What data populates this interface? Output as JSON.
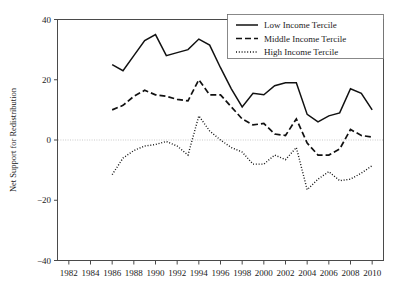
{
  "chart_data": {
    "type": "line",
    "title": "",
    "subtitle": "",
    "xlabel": "",
    "ylabel": "Net Support for Redistribution",
    "xlim": [
      1981,
      2011
    ],
    "ylim": [
      -40,
      40
    ],
    "yticks": [
      40,
      20,
      0,
      -20,
      -40
    ],
    "ytick_labels": [
      "40",
      "20",
      "0",
      "−20",
      "−40"
    ],
    "xticks": [
      1982,
      1984,
      1986,
      1988,
      1990,
      1992,
      1994,
      1996,
      1998,
      2000,
      2002,
      2004,
      2006,
      2008,
      2010
    ],
    "xtick_labels": [
      "1982",
      "1984",
      "1986",
      "1988",
      "1990",
      "1992",
      "1994",
      "1996",
      "1998",
      "2000",
      "2002",
      "2004",
      "2006",
      "2008",
      "2010"
    ],
    "grid": false,
    "zero_reference_line": 0,
    "legend_position": "top-right",
    "x": [
      1986,
      1987,
      1988,
      1989,
      1990,
      1991,
      1992,
      1993,
      1994,
      1995,
      1996,
      1997,
      1998,
      1999,
      2000,
      2001,
      2002,
      2003,
      2004,
      2005,
      2006,
      2007,
      2008,
      2009,
      2010
    ],
    "series": [
      {
        "name": "Low Income Tercile",
        "style": "solid",
        "color": "#111111",
        "values": [
          25,
          23,
          28,
          33,
          35,
          28,
          29,
          30,
          33.5,
          31.5,
          24,
          17,
          11,
          15.5,
          15,
          18,
          19,
          19,
          8.5,
          6,
          8,
          9,
          17,
          15.5,
          10
        ]
      },
      {
        "name": "Middle Income Tercile",
        "style": "dashed",
        "color": "#111111",
        "values": [
          10,
          11.5,
          14.5,
          16.5,
          15,
          14.5,
          13.5,
          13,
          20,
          15,
          15,
          11,
          7,
          5,
          5.5,
          2,
          1.5,
          7,
          -1,
          -5,
          -5,
          -3,
          3.5,
          1.5,
          1
        ]
      },
      {
        "name": "High Income Tercile",
        "style": "dotted",
        "color": "#111111",
        "values": [
          -11.5,
          -6,
          -3.5,
          -2,
          -1.5,
          -0.5,
          -2,
          -5,
          8,
          3,
          0,
          -2.5,
          -4,
          -8,
          -8,
          -5,
          -6.5,
          -2.5,
          -16.5,
          -13,
          -10.5,
          -13.5,
          -13,
          -11,
          -8.5
        ]
      }
    ]
  },
  "legend": {
    "items": [
      {
        "label": "Low Income Tercile",
        "style": "solid"
      },
      {
        "label": "Middle Income Tercile",
        "style": "dashed"
      },
      {
        "label": "High Income Tercile",
        "style": "dotted"
      }
    ]
  },
  "axes": {
    "y_title": "Net Support for Redistribution"
  }
}
